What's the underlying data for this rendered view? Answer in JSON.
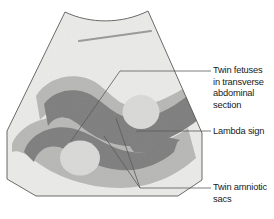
{
  "figure": {
    "modality": "ultrasound-sector-scan"
  },
  "colors": {
    "field_light": "#e8e8e6",
    "field_top": "#ececea",
    "sac_mid_gray": "#b6b6b4",
    "fetus_dark_gray": "#808080",
    "abdomen_light": "#d8d8d6",
    "outline": "#5a5a58",
    "leader_line": "#5a5a58",
    "text": "#1a1a1a",
    "wall_streak": "#9a9a98"
  },
  "callouts": [
    {
      "id": "twin-fetuses",
      "text": "Twin fetuses\nin transverse\nabdominal\nsection"
    },
    {
      "id": "lambda-sign",
      "text": "Lambda sign"
    },
    {
      "id": "twin-amniotic-sacs",
      "text": "Twin amniotic\nsacs"
    }
  ],
  "structures": [
    {
      "name": "fetus-upper",
      "label": "upper twin fetus in transverse abdominal section"
    },
    {
      "name": "fetus-lower",
      "label": "lower twin fetus in transverse abdominal section"
    },
    {
      "name": "abdomen-upper",
      "label": "upper fetal abdominal cross-section"
    },
    {
      "name": "abdomen-lower",
      "label": "lower fetal abdominal cross-section"
    },
    {
      "name": "amniotic-sac-upper",
      "label": "upper amniotic sac"
    },
    {
      "name": "amniotic-sac-lower",
      "label": "lower amniotic sac"
    },
    {
      "name": "lambda-sign",
      "label": "lambda sign / twin peak sign at membrane insertion"
    },
    {
      "name": "uterine-wall-streak",
      "label": "uterine wall echo"
    }
  ]
}
